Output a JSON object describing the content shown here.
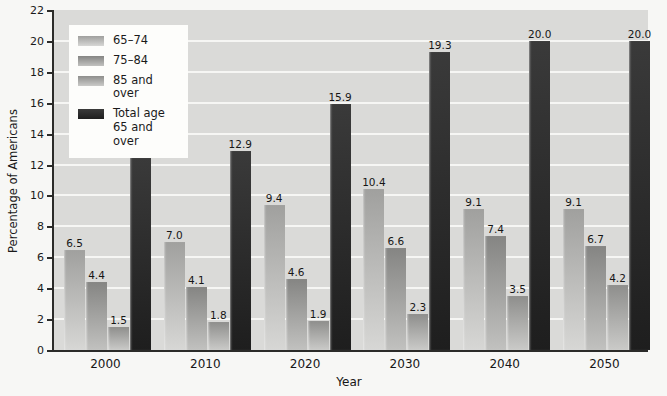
{
  "chart_data": {
    "type": "bar",
    "title": "",
    "xlabel": "Year",
    "ylabel": "Percentage of Americans",
    "ylim": [
      0,
      22
    ],
    "yticks": [
      0,
      2,
      4,
      6,
      8,
      10,
      12,
      14,
      16,
      18,
      20,
      22
    ],
    "grid": "horizontal-white-lines",
    "legend_position": "top-left-inside",
    "categories": [
      "2000",
      "2010",
      "2020",
      "2030",
      "2040",
      "2050"
    ],
    "series": [
      {
        "name": "65–74",
        "values": [
          6.5,
          7.0,
          9.4,
          10.4,
          9.1,
          9.1
        ],
        "color": "#b2b2b0",
        "gradient_top": "#a0a09e",
        "gradient_bottom": "#d7d7d5"
      },
      {
        "name": "75–84",
        "values": [
          4.4,
          4.1,
          4.6,
          6.6,
          7.4,
          6.7
        ],
        "color": "#9a9a98",
        "gradient_top": "#858583",
        "gradient_bottom": "#c1c1bf"
      },
      {
        "name": "85 and over",
        "values": [
          1.5,
          1.8,
          1.9,
          2.3,
          3.5,
          4.2
        ],
        "color": "#a4a4a2",
        "gradient_top": "#8e8e8c",
        "gradient_bottom": "#cacac8"
      },
      {
        "name": "Total age 65 and over",
        "values": [
          12.4,
          12.9,
          15.9,
          19.3,
          20.0,
          20.0
        ],
        "color": "#3a3a3a",
        "gradient_top": "#3a3a3a",
        "gradient_bottom": "#1e1e1e"
      }
    ],
    "colors": {
      "plot_background": "#dadad8",
      "page_background": "#f7f7f5",
      "gridline": "#f6f6f4",
      "axis_line": "#2b2b29",
      "legend_background": "#fdfdfb",
      "text": "#1a1a1a"
    }
  }
}
